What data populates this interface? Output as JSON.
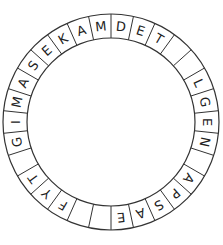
{
  "diagram": {
    "type": "letter-ring",
    "segment_count": 30,
    "start_angle_deg": 0,
    "direction": "clockwise",
    "segments": [
      "D",
      "E",
      "T",
      "",
      "",
      "L",
      "G",
      "E",
      "N",
      "",
      "A",
      "P",
      "S",
      "A",
      "E",
      "",
      "",
      "F",
      "Y",
      "T",
      "",
      "G",
      "I",
      "M",
      "A",
      "S",
      "E",
      "K",
      "A",
      "M"
    ],
    "colors": {
      "stroke": "#333333",
      "text": "#222222",
      "background": "#ffffff"
    }
  }
}
